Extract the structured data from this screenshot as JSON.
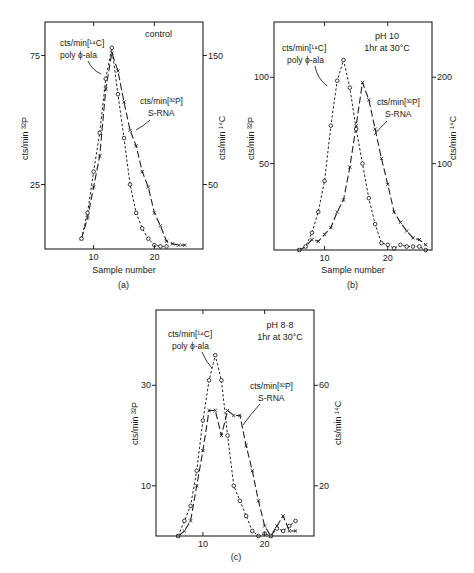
{
  "figure": {
    "panels": [
      {
        "id": "a",
        "caption": "(a)",
        "condition_lines": [
          "control"
        ],
        "xlabel": "Sample number",
        "ylabel_left": "cts/min ³²P",
        "ylabel_right": "cts/min ¹⁴C",
        "label_14c": [
          "cts/min[¹⁴C]",
          "poly ϕ-ala"
        ],
        "label_32p": [
          "cts/min[³²P]",
          "S-RNA"
        ]
      },
      {
        "id": "b",
        "caption": "(b)",
        "condition_lines": [
          "pH 10",
          "1hr at 30°C"
        ],
        "xlabel": "Sample number",
        "ylabel_left": "cts/min ³²P",
        "ylabel_right": "cts/min ¹⁴C",
        "label_14c": [
          "cts/min[¹⁴C]",
          "poly ϕ-ala"
        ],
        "label_32p": [
          "cts/min[³²P]",
          "S-RNA"
        ]
      },
      {
        "id": "c",
        "caption": "(c)",
        "condition_lines": [
          "pH 8·8",
          "1hr at 30°C"
        ],
        "xlabel": "",
        "ylabel_left": "cts/min ³²P",
        "ylabel_right": "cts/min ¹⁴C",
        "label_14c": [
          "cts/min[¹⁴C]",
          "poly ϕ-ala"
        ],
        "label_32p": [
          "cts/min[³²P]",
          "S-RNA"
        ]
      }
    ]
  },
  "chart_data": [
    {
      "type": "line",
      "panel": "(a)",
      "title": "control",
      "xlabel": "Sample number",
      "ylabel": "cts/min ³²P",
      "ylabel_right": "cts/min ¹⁴C",
      "xlim": [
        2,
        28
      ],
      "ylim": [
        0,
        88
      ],
      "ylim_right": [
        0,
        176
      ],
      "xticks": [
        10,
        20
      ],
      "yticks_left": [
        25,
        75
      ],
      "yticks_right": [
        50,
        150
      ],
      "grid": false,
      "series": [
        {
          "name": "cts/min[³²P] S-RNA",
          "axis": "left",
          "marker": "x",
          "line": "long-dash",
          "x": [
            8,
            9,
            10,
            11,
            12,
            13,
            14,
            15,
            16,
            17,
            18,
            19,
            20,
            21,
            22,
            23,
            24,
            25
          ],
          "y": [
            4,
            12,
            24,
            36,
            62,
            76,
            69,
            57,
            46,
            40,
            30,
            24,
            14,
            9,
            3,
            2,
            1.5,
            1.5
          ]
        },
        {
          "name": "cts/min[¹⁴C] poly ϕ-ala",
          "axis": "right",
          "marker": "o",
          "line": "short-dash",
          "x": [
            8,
            9,
            10,
            11,
            12,
            13,
            14,
            15,
            16,
            17,
            18,
            19,
            20,
            21,
            22
          ],
          "y": [
            8,
            28,
            60,
            90,
            132,
            156,
            120,
            86,
            50,
            28,
            16,
            8,
            3,
            2,
            2
          ]
        }
      ]
    },
    {
      "type": "line",
      "panel": "(b)",
      "title": "pH 10, 1hr at 30°C",
      "xlabel": "Sample number",
      "ylabel": "cts/min ³²P",
      "ylabel_right": "cts/min ¹⁴C",
      "xlim": [
        2,
        27
      ],
      "ylim": [
        0,
        132
      ],
      "ylim_right": [
        0,
        264
      ],
      "xticks": [
        10,
        20
      ],
      "yticks_left": [
        50,
        100
      ],
      "yticks_right": [
        100,
        200
      ],
      "grid": false,
      "series": [
        {
          "name": "cts/min[³²P] S-RNA",
          "axis": "left",
          "marker": "x",
          "line": "long-dash",
          "x": [
            6,
            7,
            8,
            9,
            10,
            11,
            12,
            13,
            14,
            15,
            16,
            17,
            18,
            19,
            20,
            21,
            22,
            23,
            24,
            25,
            26
          ],
          "y": [
            0,
            2,
            6,
            5,
            9,
            13,
            22,
            29,
            48,
            72,
            97,
            87,
            70,
            53,
            38,
            22,
            16,
            11,
            7,
            6,
            3
          ]
        },
        {
          "name": "cts/min[¹⁴C] poly ϕ-ala",
          "axis": "right",
          "marker": "o",
          "line": "short-dash",
          "x": [
            6,
            7,
            8,
            9,
            10,
            11,
            12,
            13,
            14,
            15,
            16,
            17,
            18,
            19,
            20,
            21,
            22,
            23,
            24,
            25,
            26
          ],
          "y": [
            0,
            4,
            20,
            44,
            80,
            144,
            196,
            220,
            188,
            140,
            100,
            60,
            30,
            8,
            6,
            2,
            6,
            4,
            4,
            4,
            0
          ]
        }
      ]
    },
    {
      "type": "line",
      "panel": "(c)",
      "title": "pH 8·8, 1hr at 30°C",
      "xlabel": "",
      "ylabel": "cts/min ³²P",
      "ylabel_right": "cts/min ¹⁴C",
      "xlim": [
        2.4,
        28
      ],
      "ylim": [
        0,
        45
      ],
      "ylim_right": [
        0,
        90
      ],
      "xticks": [
        10,
        20
      ],
      "yticks_left": [
        10,
        30
      ],
      "yticks_right": [
        20,
        60
      ],
      "grid": false,
      "series": [
        {
          "name": "cts/min[³²P] S-RNA",
          "axis": "left",
          "marker": "x",
          "line": "long-dash",
          "x": [
            6,
            7,
            8,
            9,
            10,
            11,
            12,
            13,
            14,
            15,
            16,
            17,
            18,
            19,
            20,
            21,
            22,
            23,
            24,
            25
          ],
          "y": [
            0,
            1,
            3,
            10,
            17,
            25,
            25,
            20,
            25,
            24,
            24,
            18,
            13,
            7,
            2,
            0,
            2,
            4,
            1,
            1
          ]
        },
        {
          "name": "cts/min[¹⁴C] poly ϕ-ala",
          "axis": "right",
          "marker": "o",
          "line": "short-dash",
          "x": [
            6,
            7,
            8,
            9,
            10,
            11,
            12,
            13,
            14,
            15,
            16,
            17,
            18,
            19,
            20,
            21,
            22,
            23,
            24,
            25
          ],
          "y": [
            0,
            6,
            12,
            26,
            46,
            62,
            72,
            62,
            40,
            20,
            14,
            8,
            2,
            0,
            1,
            0,
            3,
            2,
            4,
            6
          ]
        }
      ]
    }
  ]
}
